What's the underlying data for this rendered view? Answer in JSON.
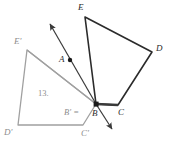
{
  "figure": {
    "type": "geometry-transformation-diagram",
    "width": 170,
    "height": 152,
    "background_color": "#ffffff",
    "colors": {
      "preimage_stroke": "#2b2b2b",
      "image_stroke": "#a0a0a0",
      "emphasis_stroke": "#3a3a3a",
      "label_dark": "#2b2b2b",
      "label_light": "#8d8d8d",
      "point_fill": "#1a1a1a"
    },
    "labels": {
      "E": "E",
      "D": "D",
      "C": "C",
      "B": "B",
      "A": "A",
      "E_prime": "E'",
      "D_prime": "D'",
      "C_prime": "C'",
      "step_number": "13.",
      "mapping_note": "B' ="
    },
    "shapes": {
      "preimage": {
        "name": "quadrilateral-EDCB",
        "vertices": [
          "E",
          "D",
          "C",
          "B"
        ],
        "points": "85,17 152,52 118,105 96,104",
        "stroke": "#2b2b2b",
        "stroke_width": 1.6
      },
      "image": {
        "name": "quadrilateral-E-prime-B-prime-C-prime-D-prime",
        "vertices": [
          "E'",
          "B'",
          "C'",
          "D'"
        ],
        "points": "27,50 96,104 83,125 18,125",
        "stroke": "#a0a0a0",
        "stroke_width": 1.3
      }
    },
    "emphasis_segment": {
      "name": "segment-BC",
      "from": "96,104",
      "to": "118,105",
      "stroke": "#3a3a3a",
      "stroke_width": 2.6
    },
    "points": [
      {
        "name": "A",
        "x": 70,
        "y": 60,
        "r": 2.2
      },
      {
        "name": "B",
        "x": 96,
        "y": 104,
        "r": 2.6
      }
    ],
    "arrows": [
      {
        "name": "ray-through-A-upper",
        "x1": 96,
        "y1": 104,
        "x2": 49,
        "y2": 23,
        "stroke": "#3a3a3a",
        "stroke_width": 1.2
      },
      {
        "name": "ray-lower-right",
        "x1": 96,
        "y1": 104,
        "x2": 113,
        "y2": 131,
        "stroke": "#3a3a3a",
        "stroke_width": 1.2
      }
    ],
    "connectors": [
      {
        "name": "gray-line-E-prime-to-B",
        "x1": 27,
        "y1": 50,
        "x2": 96,
        "y2": 104,
        "stroke": "#a0a0a0",
        "stroke_width": 1.3
      }
    ],
    "label_positions": {
      "E": {
        "x": 78,
        "y": 3
      },
      "D": {
        "x": 156,
        "y": 44
      },
      "C": {
        "x": 118,
        "y": 108
      },
      "B": {
        "x": 92,
        "y": 109
      },
      "A": {
        "x": 59,
        "y": 55
      },
      "E_prime": {
        "x": 14,
        "y": 37
      },
      "D_prime": {
        "x": 4,
        "y": 128
      },
      "C_prime": {
        "x": 81,
        "y": 129
      },
      "step_number": {
        "x": 38,
        "y": 89
      },
      "mapping_note": {
        "x": 64,
        "y": 108
      }
    }
  }
}
